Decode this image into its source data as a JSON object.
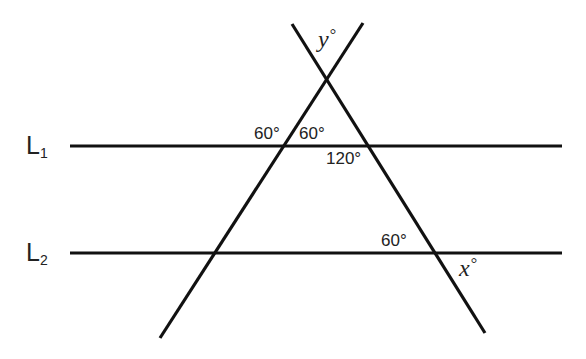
{
  "diagram": {
    "type": "parallel-lines-cut-by-two-transversals",
    "stroke_color": "#111111",
    "text_color": "#222222",
    "lines": {
      "L1": {
        "name": "L",
        "subscript": "1",
        "y": 146,
        "x1": 70,
        "x2": 562
      },
      "L2": {
        "name": "L",
        "subscript": "2",
        "y": 253,
        "x1": 70,
        "x2": 562
      },
      "transversal_left": {
        "x1": 363,
        "y1": 23,
        "x2": 160,
        "y2": 338
      },
      "transversal_right": {
        "x1": 292,
        "y1": 24,
        "x2": 485,
        "y2": 333
      }
    },
    "labels": {
      "y_angle": {
        "var": "y",
        "deg": "°"
      },
      "angle_L1_left_upper": "60°",
      "angle_L1_inner_upper": "60°",
      "angle_L1_right_lower": "120°",
      "angle_L2_right_upper": "60°",
      "x_angle": {
        "var": "x",
        "deg": "°"
      }
    }
  }
}
